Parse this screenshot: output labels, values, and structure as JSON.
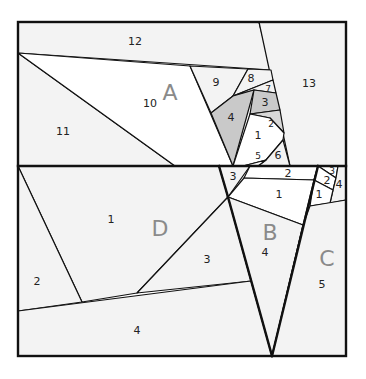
{
  "diagram": {
    "colors": {
      "outline": "#111111",
      "fill_light": "#f3f3f3",
      "fill_white": "#ffffff",
      "fill_shaded": "#c9c9c9",
      "section_letter": "#8a8a8a"
    },
    "sections": {
      "A": {
        "letter": "A",
        "pieces": [
          "1",
          "2",
          "3",
          "4",
          "5",
          "6",
          "7",
          "8",
          "9",
          "10",
          "11",
          "12",
          "13"
        ]
      },
      "B": {
        "letter": "B",
        "pieces": [
          "1",
          "2",
          "3",
          "4"
        ]
      },
      "C": {
        "letter": "C",
        "pieces": [
          "1",
          "2",
          "3",
          "4",
          "5"
        ]
      },
      "D": {
        "letter": "D",
        "pieces": [
          "1",
          "2",
          "3",
          "4"
        ]
      }
    },
    "labels": [
      {
        "id": "A12",
        "text": "12",
        "x": 135,
        "y": 41,
        "size": "n"
      },
      {
        "id": "A13",
        "text": "13",
        "x": 309,
        "y": 83,
        "size": "n"
      },
      {
        "id": "A10",
        "text": "10",
        "x": 150,
        "y": 103,
        "size": "n"
      },
      {
        "id": "A11",
        "text": "11",
        "x": 63,
        "y": 131,
        "size": "n"
      },
      {
        "id": "A9",
        "text": "9",
        "x": 216,
        "y": 82,
        "size": "n"
      },
      {
        "id": "A8",
        "text": "8",
        "x": 251,
        "y": 78,
        "size": "n"
      },
      {
        "id": "A7",
        "text": "7",
        "x": 268,
        "y": 89,
        "size": "sm"
      },
      {
        "id": "A3",
        "text": "3",
        "x": 265,
        "y": 102,
        "size": "n"
      },
      {
        "id": "A4",
        "text": "4",
        "x": 231,
        "y": 117,
        "size": "n"
      },
      {
        "id": "A2",
        "text": "2",
        "x": 271,
        "y": 124,
        "size": "sm"
      },
      {
        "id": "A1",
        "text": "1",
        "x": 258,
        "y": 135,
        "size": "n"
      },
      {
        "id": "A5",
        "text": "5",
        "x": 258,
        "y": 156,
        "size": "sm"
      },
      {
        "id": "A6",
        "text": "6",
        "x": 278,
        "y": 155,
        "size": "n"
      },
      {
        "id": "B3",
        "text": "3",
        "x": 233,
        "y": 176,
        "size": "n"
      },
      {
        "id": "B2",
        "text": "2",
        "x": 288,
        "y": 173,
        "size": "n"
      },
      {
        "id": "B1",
        "text": "1",
        "x": 279,
        "y": 194,
        "size": "n"
      },
      {
        "id": "B4",
        "text": "4",
        "x": 265,
        "y": 252,
        "size": "n"
      },
      {
        "id": "C3",
        "text": "3",
        "x": 332,
        "y": 171,
        "size": "sm"
      },
      {
        "id": "C2",
        "text": "2",
        "x": 327,
        "y": 180,
        "size": "n"
      },
      {
        "id": "C4",
        "text": "4",
        "x": 339,
        "y": 184,
        "size": "n"
      },
      {
        "id": "C1",
        "text": "1",
        "x": 319,
        "y": 194,
        "size": "n"
      },
      {
        "id": "C5",
        "text": "5",
        "x": 322,
        "y": 284,
        "size": "n"
      },
      {
        "id": "D1",
        "text": "1",
        "x": 111,
        "y": 219,
        "size": "n"
      },
      {
        "id": "D2",
        "text": "2",
        "x": 37,
        "y": 281,
        "size": "n"
      },
      {
        "id": "D3",
        "text": "3",
        "x": 207,
        "y": 259,
        "size": "n"
      },
      {
        "id": "D4",
        "text": "4",
        "x": 137,
        "y": 330,
        "size": "n"
      },
      {
        "id": "LA",
        "text": "A",
        "x": 170,
        "y": 93,
        "size": "big"
      },
      {
        "id": "LB",
        "text": "B",
        "x": 270,
        "y": 233,
        "size": "big"
      },
      {
        "id": "LC",
        "text": "C",
        "x": 327,
        "y": 259,
        "size": "big"
      },
      {
        "id": "LD",
        "text": "D",
        "x": 160,
        "y": 229,
        "size": "big"
      }
    ]
  }
}
